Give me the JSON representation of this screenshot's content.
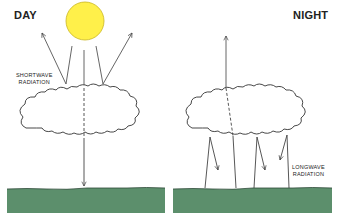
{
  "diagram": {
    "day_panel": {
      "title": "DAY",
      "label_line1": "SHORTWAVE",
      "label_line2": "RADIATION",
      "sun_color": "#fff04a",
      "ground_color": "#5c8f6c"
    },
    "night_panel": {
      "title": "NIGHT",
      "label_line1": "LONGWAVE",
      "label_line2": "RADIATION",
      "ground_color": "#5c8f6c"
    }
  }
}
